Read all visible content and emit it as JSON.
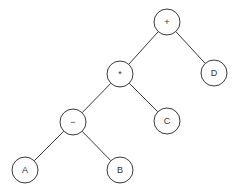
{
  "diagram": {
    "type": "expression-tree",
    "node_radius": 13,
    "colors": {
      "stroke": "#3a3a3a",
      "fill": "#ffffff",
      "text": "#333333",
      "background": "#ffffff"
    },
    "nodes": [
      {
        "id": "plus",
        "label": "+",
        "x": 167,
        "y": 22
      },
      {
        "id": "mult",
        "label": "*",
        "x": 120,
        "y": 74
      },
      {
        "id": "D",
        "label": "D",
        "x": 214,
        "y": 73
      },
      {
        "id": "minus",
        "label": "−",
        "x": 73,
        "y": 122
      },
      {
        "id": "C",
        "label": "C",
        "x": 167,
        "y": 121
      },
      {
        "id": "A",
        "label": "A",
        "x": 25,
        "y": 170
      },
      {
        "id": "B",
        "label": "B",
        "x": 120,
        "y": 170
      }
    ],
    "edges": [
      {
        "from": "plus",
        "to": "mult"
      },
      {
        "from": "plus",
        "to": "D"
      },
      {
        "from": "mult",
        "to": "minus"
      },
      {
        "from": "mult",
        "to": "C"
      },
      {
        "from": "minus",
        "to": "A"
      },
      {
        "from": "minus",
        "to": "B"
      }
    ]
  }
}
